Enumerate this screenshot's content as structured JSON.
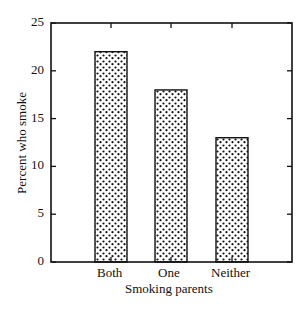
{
  "chart_data": {
    "type": "bar",
    "title": "",
    "xlabel": "Smoking parents",
    "ylabel": "Percent who smoke",
    "categories": [
      "Both",
      "One",
      "Neither"
    ],
    "values": [
      22,
      18,
      13
    ],
    "ylim": [
      0,
      25
    ],
    "yticks": [
      0,
      5,
      10,
      15,
      20,
      25
    ],
    "grid": false,
    "legend": null,
    "bar_fill": "stippled dots",
    "colors": {
      "axis": "#111111",
      "bar_dot": "#111111",
      "bar_bg": "#ffffff"
    }
  },
  "labels": {
    "xlabel": "Smoking parents",
    "ylabel": "Percent who smoke",
    "cat0": "Both",
    "cat1": "One",
    "cat2": "Neither",
    "y0": "0",
    "y5": "5",
    "y10": "10",
    "y15": "15",
    "y20": "20",
    "y25": "25"
  }
}
